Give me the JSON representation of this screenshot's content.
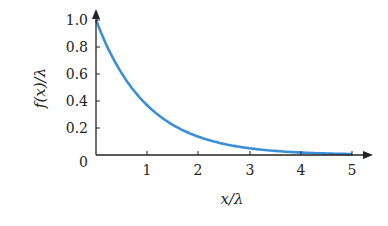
{
  "chart_data": {
    "type": "line",
    "title": "",
    "xlabel": "x/λ",
    "ylabel": "f(x)/λ",
    "xlim": [
      0,
      5
    ],
    "ylim": [
      0,
      1.0
    ],
    "grid": false,
    "x_ticks": [
      "1",
      "2",
      "3",
      "4",
      "5"
    ],
    "y_ticks": [
      "0",
      "0.2",
      "0.4",
      "0.6",
      "0.8",
      "1.0"
    ],
    "series": [
      {
        "name": "f(x)/λ = exp(-x/λ)",
        "color": "#3a8fd6",
        "x": [
          0,
          0.5,
          1,
          1.5,
          2,
          2.5,
          3,
          3.5,
          4,
          4.5,
          5
        ],
        "y": [
          1.0,
          0.607,
          0.368,
          0.223,
          0.135,
          0.082,
          0.05,
          0.03,
          0.018,
          0.011,
          0.007
        ]
      }
    ]
  },
  "axes": {
    "x_label": "x/λ",
    "y_label": "f(x)/λ",
    "x_tick_labels": [
      "1",
      "2",
      "3",
      "4",
      "5"
    ],
    "y_tick_labels": [
      "1.0",
      "0.8",
      "0.6",
      "0.4",
      "0.2"
    ],
    "origin_label": "0",
    "axis_color": "#222222",
    "curve_color": "#3a8fd6"
  }
}
